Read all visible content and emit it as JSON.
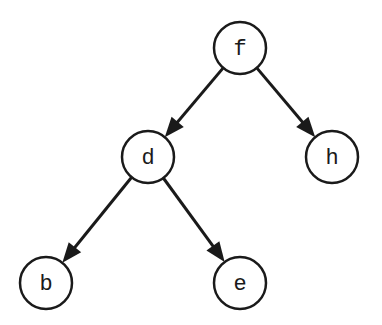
{
  "diagram": {
    "type": "binary-tree",
    "nodes": [
      {
        "id": "f",
        "label": "f",
        "x": 240,
        "y": 48
      },
      {
        "id": "d",
        "label": "d",
        "x": 148,
        "y": 157
      },
      {
        "id": "h",
        "label": "h",
        "x": 332,
        "y": 157
      },
      {
        "id": "b",
        "label": "b",
        "x": 46,
        "y": 283
      },
      {
        "id": "e",
        "label": "e",
        "x": 240,
        "y": 283
      }
    ],
    "edges": [
      {
        "from": "f",
        "to": "d"
      },
      {
        "from": "f",
        "to": "h"
      },
      {
        "from": "d",
        "to": "b"
      },
      {
        "from": "d",
        "to": "e"
      }
    ],
    "colors": {
      "stroke": "#1a1a1a",
      "fill": "#ffffff"
    }
  }
}
